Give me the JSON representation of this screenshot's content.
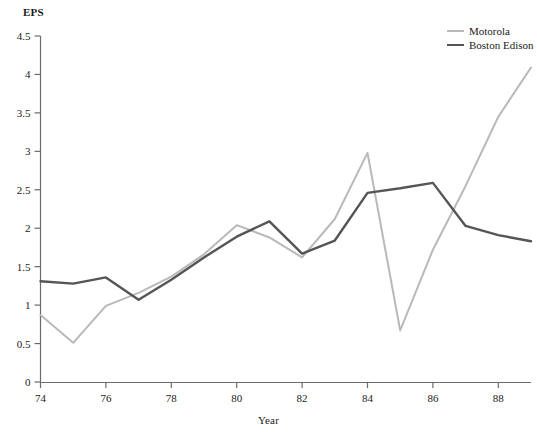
{
  "chart_data": {
    "type": "line",
    "title": "",
    "xlabel": "Year",
    "ylabel": "EPS",
    "xlim": [
      74,
      89
    ],
    "ylim": [
      0,
      4.5
    ],
    "grid": false,
    "legend_position": "top-right",
    "x": [
      74,
      75,
      76,
      77,
      78,
      79,
      80,
      81,
      82,
      83,
      84,
      85,
      86,
      87,
      88,
      89
    ],
    "xticks": [
      74,
      76,
      78,
      80,
      82,
      84,
      86,
      88
    ],
    "xtick_labels": [
      "74",
      "76",
      "78",
      "80",
      "82",
      "84",
      "86",
      "88"
    ],
    "yticks": [
      0,
      0.5,
      1,
      1.5,
      2,
      2.5,
      3,
      3.5,
      4,
      4.5
    ],
    "ytick_labels": [
      "0",
      "0.5",
      "1",
      "1.5",
      "2",
      "2.5",
      "3",
      "3.5",
      "4",
      "4.5"
    ],
    "series": [
      {
        "name": "Motorola",
        "color": "#b9b9b9",
        "width": 2,
        "values": [
          0.87,
          0.51,
          0.99,
          1.16,
          1.37,
          1.66,
          2.04,
          1.88,
          1.62,
          2.12,
          2.98,
          0.67,
          1.72,
          2.55,
          3.45,
          4.09
        ]
      },
      {
        "name": "Boston Edison",
        "color": "#555555",
        "width": 2.4,
        "values": [
          1.31,
          1.28,
          1.36,
          1.07,
          1.33,
          1.62,
          1.89,
          2.09,
          1.67,
          1.84,
          2.46,
          2.52,
          2.59,
          2.03,
          1.91,
          1.83
        ]
      }
    ]
  },
  "axes": {
    "y_title": "EPS",
    "x_title": "Year"
  },
  "legend": {
    "items": [
      {
        "label": "Motorola",
        "color": "#b9b9b9"
      },
      {
        "label": "Boston Edison",
        "color": "#555555"
      }
    ]
  }
}
